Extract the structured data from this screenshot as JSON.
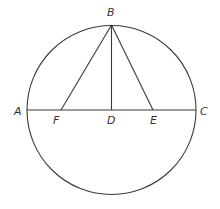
{
  "diagram": {
    "type": "geometry",
    "circle": {
      "center": "D",
      "cx": 111.5,
      "cy": 110,
      "r": 84.5
    },
    "points": {
      "A": {
        "label": "A",
        "x": 27,
        "y": 110,
        "lx": 14,
        "ly": 115
      },
      "B": {
        "label": "B",
        "x": 111.5,
        "y": 25,
        "lx": 107,
        "ly": 16
      },
      "C": {
        "label": "C",
        "x": 196,
        "y": 110,
        "lx": 200,
        "ly": 115
      },
      "D": {
        "label": "D",
        "x": 111.5,
        "y": 110,
        "lx": 107,
        "ly": 124
      },
      "E": {
        "label": "E",
        "x": 153,
        "y": 110,
        "lx": 150,
        "ly": 124
      },
      "F": {
        "label": "F",
        "x": 61,
        "y": 110,
        "lx": 53,
        "ly": 124
      }
    },
    "segments": [
      {
        "from": "A",
        "to": "C"
      },
      {
        "from": "B",
        "to": "F"
      },
      {
        "from": "B",
        "to": "D"
      },
      {
        "from": "B",
        "to": "E"
      }
    ],
    "line_color": "#3a3a3a"
  }
}
